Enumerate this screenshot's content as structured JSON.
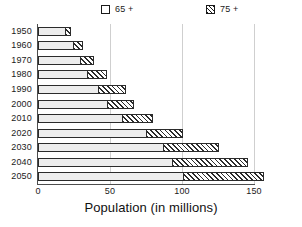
{
  "chart_data": {
    "type": "bar",
    "orientation": "horizontal",
    "stacked": true,
    "title": "",
    "xlabel": "Population (in millions)",
    "ylabel": "",
    "xlim": [
      0,
      150
    ],
    "xticks": [
      0,
      50,
      100,
      150
    ],
    "grid": "vertical",
    "legend_position": "top",
    "categories": [
      "1950",
      "1960",
      "1970",
      "1980",
      "1990",
      "2000",
      "2010",
      "2020",
      "2030",
      "2040",
      "2050"
    ],
    "series": [
      {
        "name": "65 +",
        "pattern": "dotted",
        "values": [
          19,
          24,
          29,
          34,
          42,
          48,
          58,
          75,
          87,
          93,
          101
        ]
      },
      {
        "name": "75 +",
        "pattern": "diagonal-hatch",
        "values": [
          4,
          7,
          10,
          14,
          19,
          19,
          22,
          26,
          39,
          53,
          56
        ]
      }
    ],
    "totals": [
      23,
      31,
      39,
      48,
      61,
      67,
      80,
      101,
      126,
      146,
      157
    ]
  },
  "legend": {
    "items": [
      {
        "label": "65 +",
        "swatch": "light-dotted-square"
      },
      {
        "label": "75 +",
        "swatch": "hatched-square"
      }
    ]
  },
  "axis": {
    "x_title": "Population (in millions)",
    "x_tick_labels": [
      "0",
      "50",
      "100",
      "150"
    ],
    "y_tick_labels": [
      "1950",
      "1960",
      "1970",
      "1980",
      "1990",
      "2000",
      "2010",
      "2020",
      "2030",
      "2040",
      "2050"
    ]
  },
  "colors": {
    "segment_65_fill": "#ededed",
    "segment_65_dots": "#a8a8a8",
    "segment_75_hatch": "#2b2b2b",
    "outline": "#2b2b2b",
    "gridline": "#cfcfcf",
    "axis": "#4d4d4d",
    "text": "#1a1a1a",
    "background": "#ffffff"
  }
}
